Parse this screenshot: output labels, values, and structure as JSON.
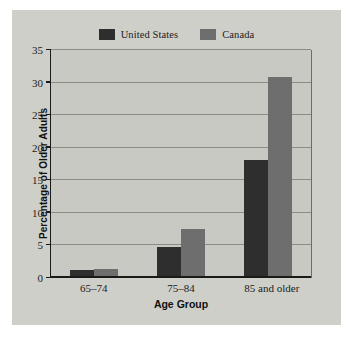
{
  "chart_data": {
    "type": "bar",
    "title": "",
    "subtitle": "",
    "xlabel": "Age Group",
    "ylabel": "Percentage of Older Adults",
    "categories": [
      "65–74",
      "75–84",
      "85 and older"
    ],
    "series": [
      {
        "name": "United States",
        "color": "#2e2e2e",
        "values": [
          1.2,
          4.7,
          18.1
        ]
      },
      {
        "name": "Canada",
        "color": "#6e6e6e",
        "values": [
          1.4,
          7.5,
          30.8
        ]
      }
    ],
    "ylim": [
      0,
      35
    ],
    "yticks": [
      0,
      5,
      10,
      15,
      20,
      25,
      30,
      35
    ],
    "ytick_labels": [
      "0",
      "5",
      "10",
      "15",
      "20",
      "25",
      "30",
      "35"
    ],
    "grid": true,
    "legend_position": "top-center",
    "plot_background": "#c9c9c3",
    "figure_background": "#cfcfc9"
  }
}
